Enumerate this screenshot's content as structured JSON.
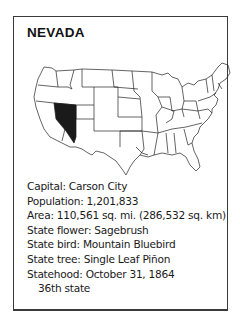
{
  "card": {
    "title": "NEVADA",
    "highlight_color": "#1a1a1a",
    "map_label": "us-map-nevada-highlighted",
    "facts": [
      "Capital: Carson City",
      "Population: 1,201,833",
      "Area: 110,561 sq. mi. (286,532 sq. km)",
      "State flower: Sagebrush",
      "State bird: Mountain Bluebird",
      "State tree: Single Leaf Piñon",
      "Statehood: October 31, 1864"
    ],
    "statehood_order": "36th state"
  }
}
